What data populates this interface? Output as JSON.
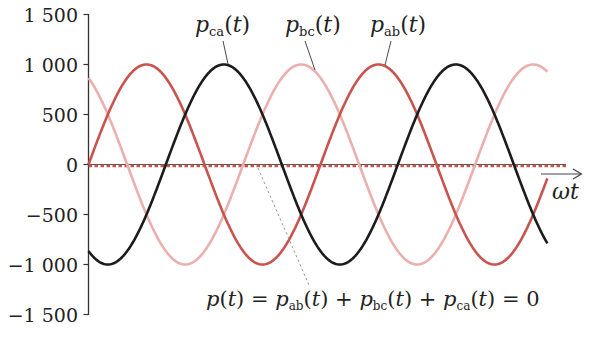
{
  "chart_data": {
    "type": "line",
    "title": "",
    "xlabel": "ωt",
    "ylabel": "",
    "ylim": [
      -1500,
      1500
    ],
    "yticks": [
      1500,
      1000,
      500,
      0,
      -500,
      -1000,
      -1500
    ],
    "ytick_labels": [
      "1 500",
      "1 000",
      "500",
      "0",
      "−500",
      "−1 000",
      "−1 500"
    ],
    "x_range_deg": [
      0,
      712
    ],
    "grid": false,
    "legend": "none (curves labeled directly with leader lines)",
    "series": [
      {
        "name": "p_ab(t)",
        "label_base": "p",
        "label_sub": "ab",
        "amplitude": 1000,
        "phase_deg": 0,
        "color": "#c9534d",
        "style": "solid",
        "peak_x_deg": [
          90,
          450
        ]
      },
      {
        "name": "p_bc(t)",
        "label_base": "p",
        "label_sub": "bc",
        "amplitude": 1000,
        "phase_deg": 120,
        "color": "#ebb0ad",
        "style": "solid",
        "peak_x_deg": [
          330,
          690
        ]
      },
      {
        "name": "p_ca(t)",
        "label_base": "p",
        "label_sub": "ca",
        "amplitude": 1000,
        "phase_deg": -120,
        "color": "#1c1c1c",
        "style": "solid",
        "peak_x_deg": [
          210,
          570
        ]
      },
      {
        "name": "p(t)",
        "amplitude": 0,
        "phase_deg": 0,
        "color": "#c9534d",
        "style": "dotted",
        "constant": 0
      }
    ],
    "annotations": [
      {
        "text": "p(t) = p_ab(t) + p_bc(t) + p_ca(t) = 0",
        "target": "p(t)"
      }
    ]
  },
  "labels": {
    "p": "p",
    "t_open": "(",
    "t": "t",
    "t_close": ")",
    "ab": "ab",
    "bc": "bc",
    "ca": "ca",
    "axis_omega_t": "ωt",
    "equation": {
      "lhs_p": "p",
      "eq1": " = ",
      "plus": " + ",
      "eq2": " = 0"
    }
  }
}
